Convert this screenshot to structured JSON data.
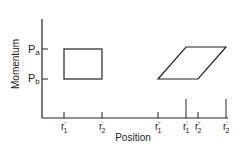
{
  "diagram": {
    "ylabel": "Momentum",
    "xlabel": "Position",
    "y_ticks": [
      {
        "label": "P",
        "sub": "a",
        "y": 49
      },
      {
        "label": "P",
        "sub": "b",
        "y": 79
      }
    ],
    "x_ticks": [
      {
        "label": "r",
        "sup": "'",
        "sub": "1",
        "x": 64
      },
      {
        "label": "r",
        "sup": "'",
        "sub": "2",
        "x": 102
      },
      {
        "label": "r",
        "sup": "\"",
        "sub": "1",
        "x": 158
      },
      {
        "label": "r",
        "sup": "'",
        "sub": "1",
        "x": 186
      },
      {
        "label": "r",
        "sup": "\"",
        "sub": "2",
        "x": 198
      },
      {
        "label": "r",
        "sup": "'",
        "sub": "2",
        "x": 226
      }
    ],
    "shapes": {
      "rectangle": "initial phase-space region (r1' to r2', Pb to Pa)",
      "parallelogram": "sheared phase-space region after free drift"
    },
    "colors": {
      "line": "#222222",
      "background": "#ffffff"
    }
  }
}
